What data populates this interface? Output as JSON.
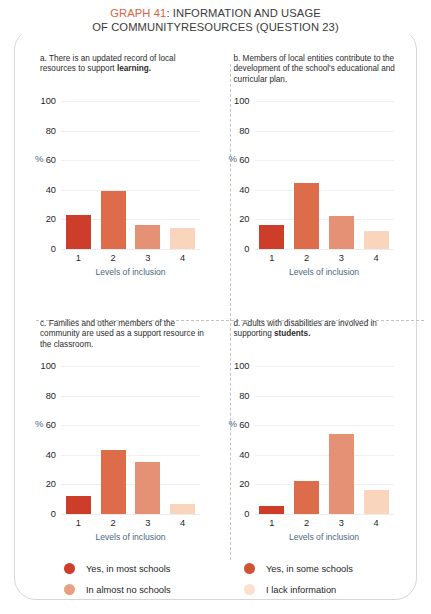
{
  "title": {
    "accent": "GRAPH 41",
    "line1_rest": ": INFORMATION AND USAGE",
    "line2": "OF COMMUNITYRESOURCES (QUESTION 23)",
    "accent_color": "#e0623f"
  },
  "axis": {
    "y_ticks": [
      "100",
      "80",
      "60",
      "40",
      "20",
      "0"
    ],
    "y_unit": "%",
    "x_ticks": [
      "1",
      "2",
      "3",
      "4"
    ],
    "x_title": "Levels of inclusion",
    "label_color": "#4b6780"
  },
  "series_colors": [
    "#ce3d29",
    "#dd6c4b",
    "#e59175",
    "#fad5be"
  ],
  "legend": {
    "items": [
      {
        "label": "Yes, in most schools",
        "color": "#ce3d29"
      },
      {
        "label": "Yes, in some schools",
        "color": "#cf5434"
      },
      {
        "label": "In almost no schools",
        "color": "#e8a083"
      },
      {
        "label": "I lack information",
        "color": "#fbe0d0"
      }
    ]
  },
  "chart_data": [
    {
      "type": "bar",
      "panel": "a",
      "title": "a. There is an updated record of local resources to support learning.",
      "title_plain": "a. There is an updated record of local resources to support ",
      "title_bold": "learning.",
      "categories": [
        "1",
        "2",
        "3",
        "4"
      ],
      "values": [
        23,
        39,
        16.5,
        14.5
      ],
      "xlabel": "Levels of inclusion",
      "ylabel": "%",
      "ylim": [
        0,
        100
      ],
      "yticks": [
        0,
        20,
        40,
        60,
        80,
        100
      ],
      "grid": true,
      "legend_position": "bottom"
    },
    {
      "type": "bar",
      "panel": "b",
      "title": "b. Members of local entities contribute to the development of the school's educational and curricular plan.",
      "title_plain": "b. Members of local entities contribute to the development of the school's educational and curricular plan.",
      "title_bold": "",
      "categories": [
        "1",
        "2",
        "3",
        "4"
      ],
      "values": [
        16,
        44.5,
        22,
        12
      ],
      "xlabel": "Levels of inclusion",
      "ylabel": "%",
      "ylim": [
        0,
        100
      ],
      "yticks": [
        0,
        20,
        40,
        60,
        80,
        100
      ],
      "grid": true,
      "legend_position": "bottom"
    },
    {
      "type": "bar",
      "panel": "c",
      "title": "c. Families and other members of the community are used as a support resource in the classroom.",
      "title_plain": "c. Families and other members of the community are used as a support resource in the classroom.",
      "title_bold": "",
      "categories": [
        "1",
        "2",
        "3",
        "4"
      ],
      "values": [
        12.5,
        43.5,
        35,
        7
      ],
      "xlabel": "Levels of inclusion",
      "ylabel": "%",
      "ylim": [
        0,
        100
      ],
      "yticks": [
        0,
        20,
        40,
        60,
        80,
        100
      ],
      "grid": true,
      "legend_position": "bottom"
    },
    {
      "type": "bar",
      "panel": "d",
      "title": "d. Adults with disabilities are involved in supporting students.",
      "title_plain": "d. Adults with disabilities are involved in supporting ",
      "title_bold": "students.",
      "categories": [
        "1",
        "2",
        "3",
        "4"
      ],
      "values": [
        5.5,
        22,
        54,
        16.5
      ],
      "xlabel": "Levels of inclusion",
      "ylabel": "%",
      "ylim": [
        0,
        100
      ],
      "yticks": [
        0,
        20,
        40,
        60,
        80,
        100
      ],
      "grid": true,
      "legend_position": "bottom"
    }
  ]
}
